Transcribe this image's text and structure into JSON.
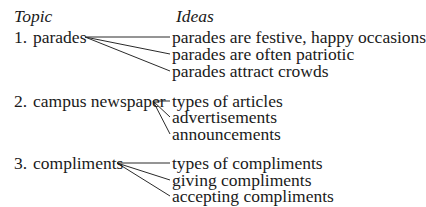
{
  "headers": {
    "topic": "Topic",
    "ideas": "Ideas"
  },
  "groups": [
    {
      "number": "1.",
      "topic": "parades",
      "ideas": [
        "parades are festive, happy occasions",
        "parades are often patriotic",
        "parades attract crowds"
      ]
    },
    {
      "number": "2.",
      "topic": "campus newspaper",
      "ideas": [
        "types of articles",
        "advertisements",
        "announcements"
      ]
    },
    {
      "number": "3.",
      "topic": "compliments",
      "ideas": [
        "types of compliments",
        "giving compliments",
        "accepting compliments"
      ]
    }
  ],
  "colors": {
    "text": "#1a1a1a",
    "line": "#2a2a2a"
  }
}
